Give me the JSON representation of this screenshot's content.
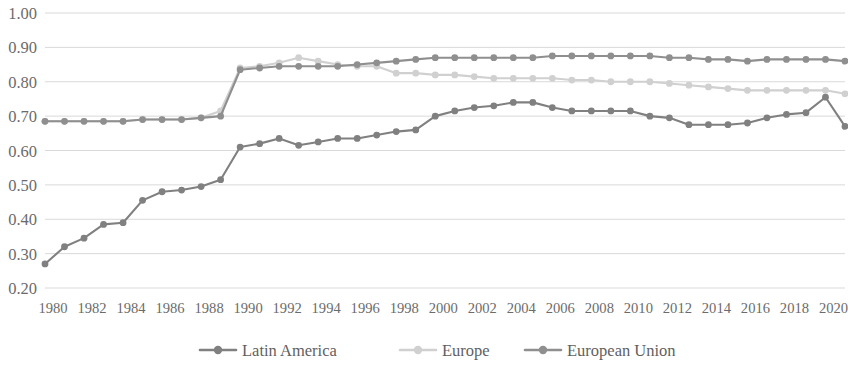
{
  "chart_data": {
    "type": "line",
    "title": "",
    "subtitle": "",
    "xlabel": "",
    "ylabel": "",
    "grid": true,
    "legend_position": "bottom",
    "xlim": [
      1980,
      2021
    ],
    "ylim": [
      0.2,
      1.0
    ],
    "ytick_step": 0.1,
    "ytick_labels": [
      "1.00",
      "0.90",
      "0.80",
      "0.70",
      "0.60",
      "0.50",
      "0.40",
      "0.30",
      "0.20"
    ],
    "ytick_values": [
      1.0,
      0.9,
      0.8,
      0.7,
      0.6,
      0.5,
      0.4,
      0.3,
      0.2
    ],
    "xtick_labels": [
      "1980",
      "1982",
      "1984",
      "1986",
      "1988",
      "1990",
      "1992",
      "1994",
      "1996",
      "1998",
      "2000",
      "2002",
      "2004",
      "2006",
      "2008",
      "2010",
      "2012",
      "2014",
      "2016",
      "2018",
      "2020"
    ],
    "xtick_values": [
      1980,
      1982,
      1984,
      1986,
      1988,
      1990,
      1992,
      1994,
      1996,
      1998,
      2000,
      2002,
      2004,
      2006,
      2008,
      2010,
      2012,
      2014,
      2016,
      2018,
      2020
    ],
    "x": [
      1980,
      1981,
      1982,
      1983,
      1984,
      1985,
      1986,
      1987,
      1988,
      1989,
      1990,
      1991,
      1992,
      1993,
      1994,
      1995,
      1996,
      1997,
      1998,
      1999,
      2000,
      2001,
      2002,
      2003,
      2004,
      2005,
      2006,
      2007,
      2008,
      2009,
      2010,
      2011,
      2012,
      2013,
      2014,
      2015,
      2016,
      2017,
      2018,
      2019,
      2020,
      2021
    ],
    "series": [
      {
        "name": "Latin America",
        "color": "#808080",
        "marker": "circle",
        "values": [
          0.27,
          0.32,
          0.345,
          0.385,
          0.39,
          0.455,
          0.48,
          0.485,
          0.495,
          0.515,
          0.61,
          0.62,
          0.635,
          0.615,
          0.625,
          0.635,
          0.635,
          0.645,
          0.655,
          0.66,
          0.7,
          0.715,
          0.725,
          0.73,
          0.74,
          0.74,
          0.725,
          0.715,
          0.715,
          0.715,
          0.715,
          0.7,
          0.695,
          0.675,
          0.675,
          0.675,
          0.68,
          0.695,
          0.705,
          0.71,
          0.755,
          0.67
        ]
      },
      {
        "name": "Europe",
        "color": "#d0d0d0",
        "marker": "circle",
        "values": [
          0.685,
          0.685,
          0.685,
          0.685,
          0.685,
          0.69,
          0.69,
          0.69,
          0.695,
          0.715,
          0.84,
          0.845,
          0.855,
          0.87,
          0.86,
          0.85,
          0.845,
          0.845,
          0.825,
          0.825,
          0.82,
          0.82,
          0.815,
          0.81,
          0.81,
          0.81,
          0.81,
          0.805,
          0.805,
          0.8,
          0.8,
          0.8,
          0.795,
          0.79,
          0.785,
          0.78,
          0.775,
          0.775,
          0.775,
          0.775,
          0.775,
          0.765
        ]
      },
      {
        "name": "European Union",
        "color": "#8f8f8f",
        "marker": "circle",
        "values": [
          0.685,
          0.685,
          0.685,
          0.685,
          0.685,
          0.69,
          0.69,
          0.69,
          0.695,
          0.7,
          0.835,
          0.84,
          0.845,
          0.845,
          0.845,
          0.845,
          0.85,
          0.855,
          0.86,
          0.865,
          0.87,
          0.87,
          0.87,
          0.87,
          0.87,
          0.87,
          0.875,
          0.875,
          0.875,
          0.875,
          0.875,
          0.875,
          0.87,
          0.87,
          0.865,
          0.865,
          0.86,
          0.865,
          0.865,
          0.865,
          0.865,
          0.86
        ]
      }
    ]
  },
  "legend": {
    "items": [
      {
        "label": "Latin America",
        "color": "#808080"
      },
      {
        "label": "Europe",
        "color": "#d0d0d0"
      },
      {
        "label": "European Union",
        "color": "#8f8f8f"
      }
    ]
  },
  "colors": {
    "background": "#ffffff",
    "gridline": "#d9d9d9",
    "axis_text": "#6b6b6b",
    "latin_america": "#808080",
    "europe": "#d0d0d0",
    "european_union": "#8f8f8f"
  }
}
